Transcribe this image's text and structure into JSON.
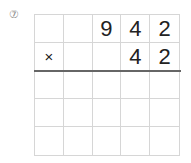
{
  "problem": {
    "number_label": "⑦",
    "rows": [
      [
        "",
        "",
        "9",
        "4",
        "2"
      ],
      [
        "×",
        "",
        "",
        "4",
        "2"
      ],
      [
        "",
        "",
        "",
        "",
        ""
      ],
      [
        "",
        "",
        "",
        "",
        ""
      ],
      [
        "",
        "",
        "",
        "",
        ""
      ]
    ]
  }
}
